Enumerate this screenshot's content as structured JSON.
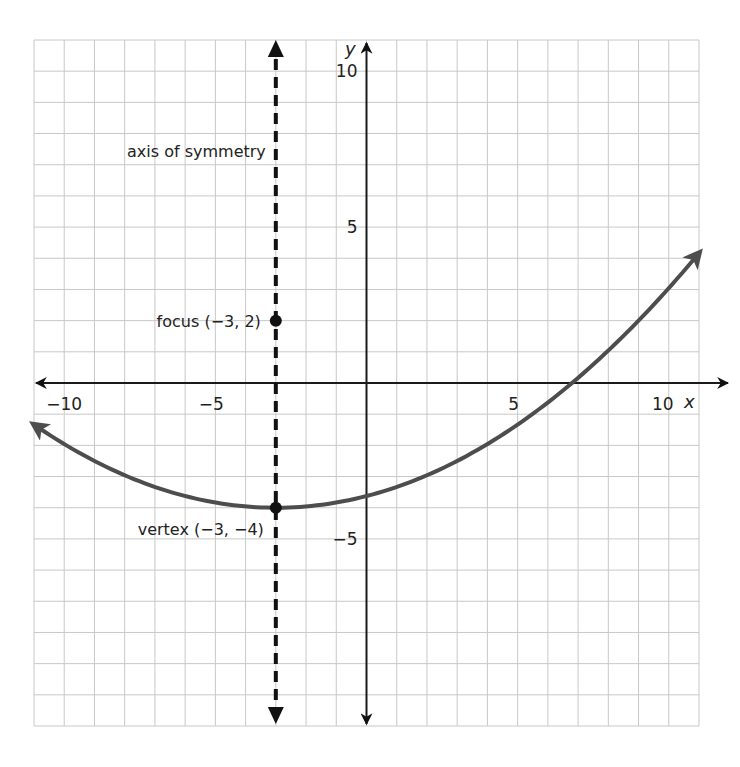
{
  "chart_data": {
    "type": "line",
    "title": "",
    "xlabel": "x",
    "ylabel": "y",
    "xlim": [
      -11,
      11
    ],
    "ylim": [
      -11,
      11
    ],
    "grid": true,
    "x_ticks": [
      {
        "value": -10,
        "label": "−10"
      },
      {
        "value": -5,
        "label": "−5"
      },
      {
        "value": 5,
        "label": "5"
      },
      {
        "value": 10,
        "label": "10"
      }
    ],
    "y_ticks": [
      {
        "value": 10,
        "label": "10"
      },
      {
        "value": 5,
        "label": "5"
      },
      {
        "value": -5,
        "label": "−5"
      }
    ],
    "series": [
      {
        "name": "parabola",
        "equation": "(x + 3)^2 = 24(y + 4)",
        "color": "#4d4d4d",
        "x_range": [
          -11,
          11
        ],
        "vertex": [
          -3,
          -4
        ],
        "p": 6
      }
    ],
    "axis_of_symmetry": {
      "x": -3,
      "label": "axis of symmetry"
    },
    "points": [
      {
        "name": "focus",
        "x": -3,
        "y": 2,
        "label": "focus (−3, 2)"
      },
      {
        "name": "vertex",
        "x": -3,
        "y": -4,
        "label": "vertex (−3, −4)"
      }
    ]
  }
}
